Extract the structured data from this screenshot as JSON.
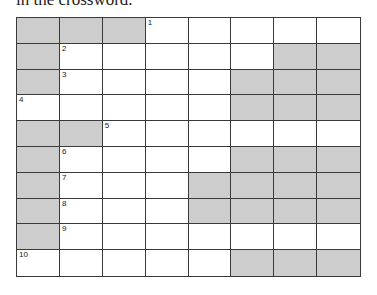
{
  "heading": "in the crossword.",
  "crossword": {
    "rows": 10,
    "cols": 8,
    "colors": {
      "block": "#cdcdcd",
      "open": "#ffffff",
      "line": "#3a3a3a"
    },
    "grid": [
      [
        "#",
        "#",
        "#",
        "1",
        ".",
        ".",
        ".",
        "."
      ],
      [
        "#",
        "2",
        ".",
        ".",
        ".",
        ".",
        "#",
        "#"
      ],
      [
        "#",
        "3",
        ".",
        ".",
        ".",
        "#",
        "#",
        "#"
      ],
      [
        "4",
        ".",
        ".",
        ".",
        ".",
        "#",
        "#",
        "#"
      ],
      [
        "#",
        "#",
        "5",
        ".",
        ".",
        ".",
        ".",
        "."
      ],
      [
        "#",
        "6",
        ".",
        ".",
        ".",
        "#",
        "#",
        "#"
      ],
      [
        "#",
        "7",
        ".",
        ".",
        "#",
        "#",
        "#",
        "#"
      ],
      [
        "#",
        "8",
        ".",
        ".",
        "#",
        "#",
        "#",
        "#"
      ],
      [
        "#",
        "9",
        ".",
        ".",
        ".",
        ".",
        ".",
        "."
      ],
      [
        "10",
        ".",
        ".",
        ".",
        ".",
        "#",
        "#",
        "#"
      ]
    ],
    "clue_numbers": [
      "1",
      "2",
      "3",
      "4",
      "5",
      "6",
      "7",
      "8",
      "9",
      "10"
    ]
  }
}
